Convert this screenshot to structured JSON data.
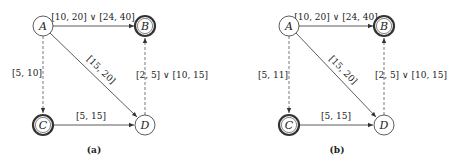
{
  "panels": [
    {
      "caption": "(a)",
      "nodes": [
        {
          "id": "A",
          "label": "A",
          "accepting": false
        },
        {
          "id": "B",
          "label": "B",
          "accepting": true
        },
        {
          "id": "C",
          "label": "C",
          "accepting": true
        },
        {
          "id": "D",
          "label": "D",
          "accepting": false
        }
      ],
      "edges": [
        {
          "from": "A",
          "to": "B",
          "label": "[10, 20] ∨ [24, 40]",
          "style": "solid"
        },
        {
          "from": "A",
          "to": "C",
          "label": "[5, 10]",
          "style": "dashed"
        },
        {
          "from": "A",
          "to": "D",
          "label": "[15, 20]",
          "style": "solid"
        },
        {
          "from": "C",
          "to": "D",
          "label": "[5, 15]",
          "style": "solid"
        },
        {
          "from": "D",
          "to": "B",
          "label": "[2, 5] ∨ [10, 15]",
          "style": "dashed"
        }
      ]
    },
    {
      "caption": "(b)",
      "nodes": [
        {
          "id": "A",
          "label": "A",
          "accepting": false
        },
        {
          "id": "B",
          "label": "B",
          "accepting": true
        },
        {
          "id": "C",
          "label": "C",
          "accepting": true
        },
        {
          "id": "D",
          "label": "D",
          "accepting": false
        }
      ],
      "edges": [
        {
          "from": "A",
          "to": "B",
          "label": "[10, 20] ∨ [24, 40]",
          "style": "solid"
        },
        {
          "from": "A",
          "to": "C",
          "label": "[5, 11]",
          "style": "dashed"
        },
        {
          "from": "A",
          "to": "D",
          "label": "[15, 20]",
          "style": "solid"
        },
        {
          "from": "C",
          "to": "D",
          "label": "[5, 15]",
          "style": "solid"
        },
        {
          "from": "D",
          "to": "B",
          "label": "[2, 5] ∨ [10, 15]",
          "style": "dashed"
        }
      ]
    }
  ]
}
